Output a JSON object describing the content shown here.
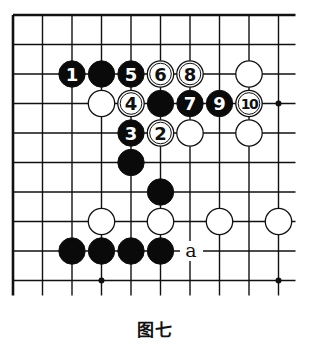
{
  "figure": {
    "caption": "图七",
    "colors": {
      "line": "#111111",
      "black_stone": "#0a0a0a",
      "white_stone": "#ffffff",
      "background": "#ffffff"
    }
  },
  "board": {
    "origin_x": 13,
    "origin_y": 15,
    "spacing_x": 29.5,
    "spacing_y": 29.5,
    "cols": 10,
    "rows": 10,
    "line_extend_right": 17,
    "line_extend_bottom": 15,
    "edges": {
      "top": true,
      "left": true,
      "right": false,
      "bottom": false
    },
    "star_points": [
      {
        "col": 9,
        "row": 3
      },
      {
        "col": 3,
        "row": 9
      },
      {
        "col": 9,
        "row": 9
      }
    ],
    "stones": [
      {
        "col": 2,
        "row": 2,
        "color": "black",
        "label": "1"
      },
      {
        "col": 3,
        "row": 2,
        "color": "black",
        "label": ""
      },
      {
        "col": 4,
        "row": 2,
        "color": "black",
        "label": "5"
      },
      {
        "col": 5,
        "row": 2,
        "color": "white",
        "label": "6"
      },
      {
        "col": 6,
        "row": 2,
        "color": "white",
        "label": "8"
      },
      {
        "col": 8,
        "row": 2,
        "color": "white",
        "label": ""
      },
      {
        "col": 3,
        "row": 3,
        "color": "white",
        "label": ""
      },
      {
        "col": 4,
        "row": 3,
        "color": "white",
        "label": "4"
      },
      {
        "col": 5,
        "row": 3,
        "color": "black",
        "label": ""
      },
      {
        "col": 6,
        "row": 3,
        "color": "black",
        "label": "7"
      },
      {
        "col": 7,
        "row": 3,
        "color": "black",
        "label": "9"
      },
      {
        "col": 8,
        "row": 3,
        "color": "white",
        "label": "10"
      },
      {
        "col": 4,
        "row": 4,
        "color": "black",
        "label": "3"
      },
      {
        "col": 5,
        "row": 4,
        "color": "white",
        "label": "2"
      },
      {
        "col": 6,
        "row": 4,
        "color": "white",
        "label": ""
      },
      {
        "col": 8,
        "row": 4,
        "color": "white",
        "label": ""
      },
      {
        "col": 4,
        "row": 5,
        "color": "black",
        "label": ""
      },
      {
        "col": 5,
        "row": 6,
        "color": "black",
        "label": ""
      },
      {
        "col": 3,
        "row": 7,
        "color": "white",
        "label": ""
      },
      {
        "col": 5,
        "row": 7,
        "color": "white",
        "label": ""
      },
      {
        "col": 7,
        "row": 7,
        "color": "white",
        "label": ""
      },
      {
        "col": 9,
        "row": 7,
        "color": "white",
        "label": ""
      },
      {
        "col": 2,
        "row": 8,
        "color": "black",
        "label": ""
      },
      {
        "col": 3,
        "row": 8,
        "color": "black",
        "label": ""
      },
      {
        "col": 4,
        "row": 8,
        "color": "black",
        "label": ""
      },
      {
        "col": 5,
        "row": 8,
        "color": "black",
        "label": ""
      }
    ],
    "markers": [
      {
        "col": 6,
        "row": 8,
        "text": "a"
      }
    ]
  }
}
